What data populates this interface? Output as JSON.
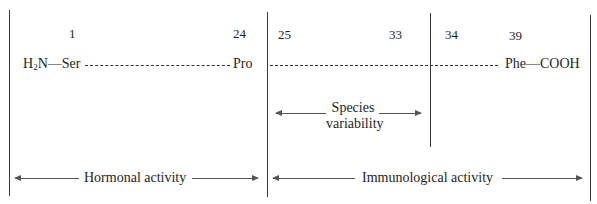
{
  "diagram": {
    "residue_numbers": {
      "n1": "1",
      "n24": "24",
      "n25": "25",
      "n33": "33",
      "n34": "34",
      "n39": "39"
    },
    "chain": {
      "n_terminus_prefix": "H",
      "n_terminus_subscript": "2",
      "n_terminus_suffix": "N—Ser",
      "residue_24": "Pro",
      "c_terminus": "Phe—COOH"
    },
    "regions": {
      "species_variability_line1": "Species",
      "species_variability_line2": "variability",
      "hormonal_activity": "Hormonal activity",
      "immunological_activity": "Immunological activity"
    },
    "colors": {
      "line": "#3a3a3a",
      "text": "#1e1e1e",
      "background": "#ffffff"
    }
  }
}
